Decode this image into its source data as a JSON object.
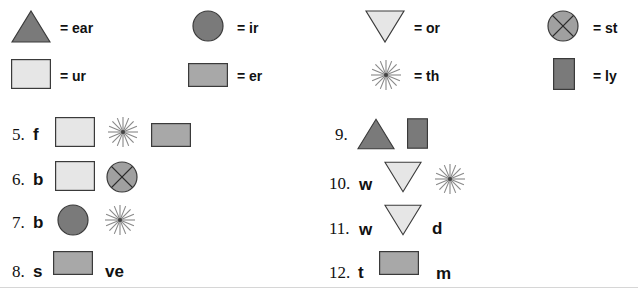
{
  "colors": {
    "dark_fill": "#7a7a7a",
    "medium_fill": "#a8a8a8",
    "light_fill": "#e6e6e6",
    "stroke": "#3a3a3a",
    "starburst": "#888888"
  },
  "key": [
    {
      "shape": "triangle-up-icon",
      "label": "= ear"
    },
    {
      "shape": "circle-icon",
      "label": "= ir"
    },
    {
      "shape": "triangle-down-icon",
      "label": "= or"
    },
    {
      "shape": "crossed-circle-icon",
      "label": "= st"
    },
    {
      "shape": "light-rectangle-icon",
      "label": "= ur"
    },
    {
      "shape": "medium-rectangle-icon",
      "label": "= er"
    },
    {
      "shape": "starburst-icon",
      "label": "= th"
    },
    {
      "shape": "tall-rectangle-icon",
      "label": "= ly"
    }
  ],
  "exercises": [
    {
      "number": "5.",
      "parts": [
        "f",
        "light-rectangle-icon",
        "starburst-icon",
        "medium-rectangle-icon"
      ]
    },
    {
      "number": "6.",
      "parts": [
        "b",
        "light-rectangle-icon",
        "crossed-circle-icon"
      ]
    },
    {
      "number": "7.",
      "parts": [
        "b",
        "circle-icon",
        "starburst-icon"
      ]
    },
    {
      "number": "8.",
      "parts": [
        "s",
        "medium-rectangle-icon",
        "ve"
      ]
    },
    {
      "number": "9.",
      "parts": [
        "triangle-up-icon",
        "tall-rectangle-icon"
      ]
    },
    {
      "number": "10.",
      "parts": [
        "w",
        "triangle-down-icon",
        "starburst-icon"
      ]
    },
    {
      "number": "11.",
      "parts": [
        "w",
        "triangle-down-icon",
        "d"
      ]
    },
    {
      "number": "12.",
      "parts": [
        "t",
        "medium-rectangle-icon",
        "m"
      ]
    }
  ]
}
